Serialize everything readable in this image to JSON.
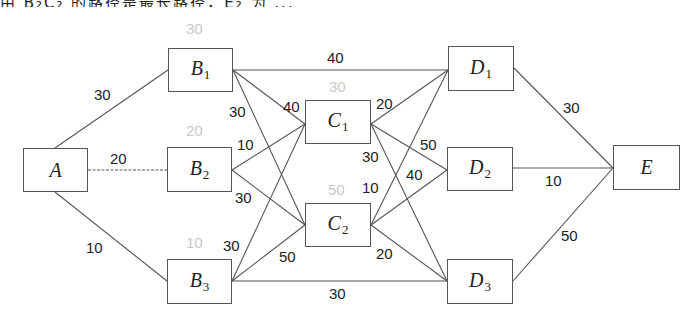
{
  "top_text_fragment": "由 B₂C₂ 的路径是最长路径，E₂ 为 ...",
  "nodes": {
    "A": {
      "letter": "A",
      "sub": "",
      "x": 23,
      "y": 148,
      "w": 65,
      "h": 44
    },
    "B1": {
      "letter": "B",
      "sub": "1",
      "x": 168,
      "y": 48,
      "w": 65,
      "h": 44
    },
    "B2": {
      "letter": "B",
      "sub": "2",
      "x": 167,
      "y": 147,
      "w": 65,
      "h": 45
    },
    "B3": {
      "letter": "B",
      "sub": "3",
      "x": 167,
      "y": 259,
      "w": 65,
      "h": 45
    },
    "C1": {
      "letter": "C",
      "sub": "1",
      "x": 305,
      "y": 100,
      "w": 66,
      "h": 44
    },
    "C2": {
      "letter": "C",
      "sub": "2",
      "x": 305,
      "y": 203,
      "w": 66,
      "h": 44
    },
    "D1": {
      "letter": "D",
      "sub": "1",
      "x": 448,
      "y": 46,
      "w": 66,
      "h": 45
    },
    "D2": {
      "letter": "D",
      "sub": "2",
      "x": 447,
      "y": 147,
      "w": 66,
      "h": 44
    },
    "D3": {
      "letter": "D",
      "sub": "3",
      "x": 447,
      "y": 259,
      "w": 66,
      "h": 45
    },
    "E": {
      "letter": "E",
      "sub": "",
      "x": 613,
      "y": 145,
      "w": 67,
      "h": 45
    }
  },
  "node_capacities": {
    "B1": {
      "value": "30",
      "x": 186,
      "y": 21
    },
    "B2": {
      "value": "20",
      "x": 186,
      "y": 123
    },
    "B3": {
      "value": "10",
      "x": 186,
      "y": 235
    },
    "C1": {
      "value": "30",
      "x": 329,
      "y": 79
    },
    "C2": {
      "value": "50",
      "x": 328,
      "y": 182
    }
  },
  "edges": [
    {
      "from": "A",
      "to": "B1",
      "weight": "30",
      "x1": 55,
      "y1": 148,
      "x2": 168,
      "y2": 70,
      "lx": 94,
      "ly": 87
    },
    {
      "from": "A",
      "to": "B2",
      "weight": "20",
      "x1": 88,
      "y1": 170,
      "x2": 167,
      "y2": 170,
      "lx": 110,
      "ly": 151,
      "dashed": true
    },
    {
      "from": "A",
      "to": "B3",
      "weight": "10",
      "x1": 55,
      "y1": 192,
      "x2": 167,
      "y2": 281,
      "lx": 86,
      "ly": 240
    },
    {
      "from": "B1",
      "to": "D1",
      "weight": "40",
      "x1": 233,
      "y1": 70,
      "x2": 448,
      "y2": 70,
      "lx": 327,
      "ly": 50
    },
    {
      "from": "B1",
      "to": "C1",
      "weight": "40",
      "x1": 233,
      "y1": 70,
      "x2": 305,
      "y2": 124,
      "lx": 283,
      "ly": 99
    },
    {
      "from": "B1",
      "to": "C2",
      "weight": "30",
      "x1": 233,
      "y1": 70,
      "x2": 305,
      "y2": 225,
      "lx": 229,
      "ly": 104
    },
    {
      "from": "B2",
      "to": "C1",
      "weight": "10",
      "x1": 232,
      "y1": 170,
      "x2": 305,
      "y2": 124,
      "lx": 237,
      "ly": 137
    },
    {
      "from": "B2",
      "to": "C2",
      "weight": "30",
      "x1": 232,
      "y1": 170,
      "x2": 305,
      "y2": 225,
      "lx": 235,
      "ly": 190
    },
    {
      "from": "B3",
      "to": "C1",
      "weight": "30",
      "x1": 232,
      "y1": 281,
      "x2": 305,
      "y2": 124,
      "lx": 223,
      "ly": 238
    },
    {
      "from": "B3",
      "to": "C2",
      "weight": "50",
      "x1": 232,
      "y1": 281,
      "x2": 305,
      "y2": 225,
      "lx": 279,
      "ly": 249
    },
    {
      "from": "B3",
      "to": "D3",
      "weight": "30",
      "x1": 232,
      "y1": 281,
      "x2": 447,
      "y2": 281,
      "lx": 329,
      "ly": 286
    },
    {
      "from": "C1",
      "to": "D1",
      "weight": "20",
      "x1": 371,
      "y1": 124,
      "x2": 448,
      "y2": 70,
      "lx": 376,
      "ly": 96
    },
    {
      "from": "C1",
      "to": "D2",
      "weight": "50",
      "x1": 371,
      "y1": 124,
      "x2": 447,
      "y2": 170,
      "lx": 420,
      "ly": 137
    },
    {
      "from": "C1",
      "to": "D3",
      "weight": "30",
      "x1": 371,
      "y1": 124,
      "x2": 447,
      "y2": 281,
      "lx": 362,
      "ly": 149
    },
    {
      "from": "C2",
      "to": "D1",
      "weight": "10",
      "x1": 371,
      "y1": 225,
      "x2": 448,
      "y2": 70,
      "lx": 362,
      "ly": 180
    },
    {
      "from": "C2",
      "to": "D2",
      "weight": "40",
      "x1": 371,
      "y1": 225,
      "x2": 447,
      "y2": 170,
      "lx": 406,
      "ly": 167
    },
    {
      "from": "C2",
      "to": "D3",
      "weight": "20",
      "x1": 371,
      "y1": 225,
      "x2": 447,
      "y2": 281,
      "lx": 376,
      "ly": 246
    },
    {
      "from": "D1",
      "to": "E",
      "weight": "30",
      "x1": 514,
      "y1": 68,
      "x2": 613,
      "y2": 168,
      "lx": 563,
      "ly": 100
    },
    {
      "from": "D2",
      "to": "E",
      "weight": "10",
      "x1": 513,
      "y1": 168,
      "x2": 613,
      "y2": 168,
      "lx": 545,
      "ly": 173
    },
    {
      "from": "D3",
      "to": "E",
      "weight": "50",
      "x1": 513,
      "y1": 281,
      "x2": 613,
      "y2": 168,
      "lx": 561,
      "ly": 228
    }
  ],
  "colors": {
    "line": "#555555",
    "text": "#222222",
    "capacity_text": "#c8c8c8",
    "background": "#ffffff"
  }
}
